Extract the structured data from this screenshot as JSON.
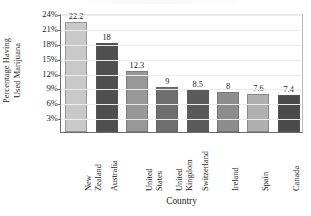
{
  "chart_data": {
    "type": "bar",
    "title": "",
    "xlabel": "Country",
    "ylabel": "Percentage Having Used Marijuana",
    "ylabel_lines": [
      "Percentage Having",
      "Used Marijuana"
    ],
    "categories": [
      "New Zealand",
      "Australia",
      "United States",
      "United Kingdom",
      "Switzerland",
      "Ireland",
      "Spain",
      "Canada"
    ],
    "category_lines": [
      [
        "New",
        "Zealand"
      ],
      [
        "Australia"
      ],
      [
        "United",
        "States"
      ],
      [
        "United",
        "Kingdom"
      ],
      [
        "Switzerland"
      ],
      [
        "Ireland"
      ],
      [
        "Spain"
      ],
      [
        "Canada"
      ]
    ],
    "values": [
      22.2,
      18,
      12.3,
      9,
      8.5,
      8,
      7.6,
      7.4
    ],
    "value_labels": [
      "22.2",
      "18",
      "12.3",
      "9",
      "8.5",
      "8",
      "7.6",
      "7.4"
    ],
    "ylim": [
      0,
      24
    ],
    "ytick_values": [
      3,
      6,
      9,
      12,
      15,
      18,
      21,
      24
    ],
    "ytick_labels": [
      "3%",
      "6%",
      "9%",
      "12%",
      "15%",
      "18%",
      "21%",
      "24%"
    ],
    "grid": true,
    "legend": "none",
    "bar_colors": [
      "#c9c9c9",
      "#4f4f4f",
      "#989898",
      "#6e6e6e",
      "#5a5a5a",
      "#8d8d8d",
      "#b0b0b0",
      "#4a4a4a"
    ],
    "axis_color": "#6b6b6b",
    "gridline_color": "#ececec"
  }
}
